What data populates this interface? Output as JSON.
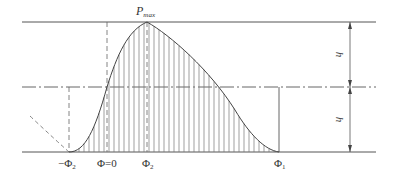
{
  "diagram": {
    "labels": {
      "pmax": "P",
      "pmax_sub": "max",
      "h_upper": "h",
      "h_lower": "h",
      "neg_phi2": "−Φ",
      "neg_phi2_sub": "2",
      "phi0": "Φ=0",
      "phi2": "Φ",
      "phi2_sub": "2",
      "phi1": "Φ",
      "phi1_sub": "1"
    },
    "colors": {
      "line": "#555555",
      "hatch": "#666666",
      "background": "#ffffff"
    },
    "geometry": {
      "top_line_y": 22,
      "mid_line_y": 87,
      "bottom_line_y": 152,
      "x_neg_phi2": 69,
      "x_phi0": 107,
      "x_phi2": 147,
      "x_phi1": 279,
      "dimension_x": 350
    }
  }
}
